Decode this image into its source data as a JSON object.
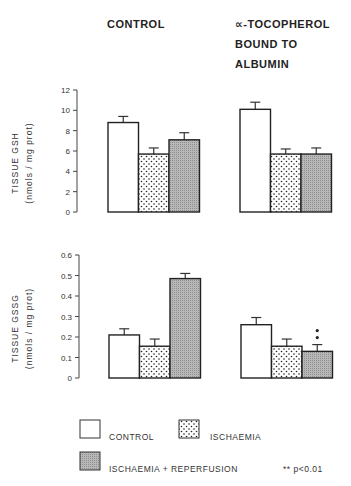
{
  "headers": {
    "control": "CONTROL",
    "tocopherol_line1": "∝-TOCOPHEROL",
    "tocopherol_line2": "BOUND TO",
    "tocopherol_line3": "ALBUMIN"
  },
  "legend": {
    "control": "CONTROL",
    "ischaemia": "ISCHAEMIA",
    "reperfusion": "ISCHAEMIA + REPERFUSION",
    "significance": "** p<0.01"
  },
  "chart_data": [
    {
      "type": "bar",
      "title": "Tissue GSH",
      "ylabel": "TISSUE GSH",
      "ylabel_units": "(nmols / mg prot)",
      "ylim": [
        0,
        12
      ],
      "yticks": [
        "0",
        "2",
        "4",
        "6",
        "8",
        "10",
        "12"
      ],
      "groups": [
        "CONTROL",
        "∝-TOCOPHEROL BOUND TO ALBUMIN"
      ],
      "series": [
        {
          "name": "CONTROL",
          "pattern": "white",
          "values": [
            8.8,
            10.1
          ],
          "errors": [
            0.6,
            0.7
          ]
        },
        {
          "name": "ISCHAEMIA",
          "pattern": "dotted",
          "values": [
            5.7,
            5.7
          ],
          "errors": [
            0.6,
            0.5
          ]
        },
        {
          "name": "ISCHAEMIA + REPERFUSION",
          "pattern": "grey-hatched",
          "values": [
            7.1,
            5.7
          ],
          "errors": [
            0.7,
            0.6
          ]
        }
      ],
      "grid": false
    },
    {
      "type": "bar",
      "title": "Tissue GSSG",
      "ylabel": "TISSUE GSSG",
      "ylabel_units": "(nmols / mg prot)",
      "ylim": [
        0,
        0.6
      ],
      "yticks": [
        "0",
        "0.1",
        "0.2",
        "0.3",
        "0.4",
        "0.5",
        "0.6"
      ],
      "groups": [
        "CONTROL",
        "∝-TOCOPHEROL BOUND TO ALBUMIN"
      ],
      "series": [
        {
          "name": "CONTROL",
          "pattern": "white",
          "values": [
            0.21,
            0.26
          ],
          "errors": [
            0.03,
            0.035
          ]
        },
        {
          "name": "ISCHAEMIA",
          "pattern": "dotted",
          "values": [
            0.155,
            0.155
          ],
          "errors": [
            0.035,
            0.035
          ]
        },
        {
          "name": "ISCHAEMIA + REPERFUSION",
          "pattern": "grey-hatched",
          "values": [
            0.485,
            0.13
          ],
          "errors": [
            0.025,
            0.033
          ]
        }
      ],
      "annotations": [
        {
          "text": "**",
          "group": 1,
          "series": 2
        }
      ],
      "grid": false
    }
  ]
}
